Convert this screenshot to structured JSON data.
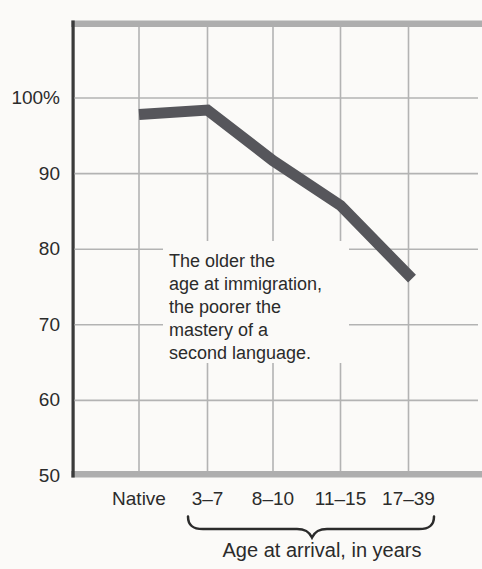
{
  "figure": {
    "background_color": "#fbfaf8",
    "text_color": "#2b2b2b"
  },
  "chart_data": {
    "type": "line",
    "title": "",
    "xlabel": "Age at arrival, in years",
    "ylabel": "",
    "categories": [
      "Native",
      "3–7",
      "8–10",
      "11–15",
      "17–39"
    ],
    "series": [
      {
        "name": "second-language-mastery-percent",
        "values": [
          97.8,
          98.4,
          91.7,
          85.8,
          76.1
        ]
      }
    ],
    "y_axis": {
      "tick_labels": [
        "100%",
        "90",
        "80",
        "70",
        "60",
        "50"
      ],
      "tick_values": [
        100,
        90,
        80,
        70,
        60,
        50
      ],
      "ylim": [
        50,
        110
      ]
    },
    "grid": true,
    "legend": "none",
    "line_color": "#56565b",
    "grid_color": "#b3b3b3",
    "frame_bar_color": "#aeaeae",
    "axis_color": "#3a3a3a",
    "annotation": "The older the\nage at immigration,\nthe poorer the\nmastery of a\nsecond language."
  }
}
